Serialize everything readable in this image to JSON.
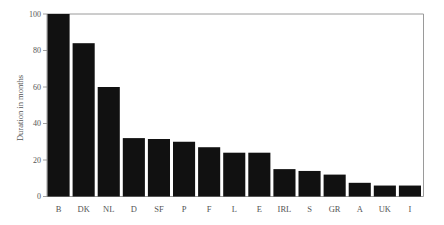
{
  "chart_data": {
    "type": "bar",
    "title": "",
    "xlabel": "",
    "ylabel": "Duration in months",
    "categories": [
      "B",
      "DK",
      "NL",
      "D",
      "SF",
      "P",
      "F",
      "L",
      "E",
      "IRL",
      "S",
      "GR",
      "A",
      "UK",
      "I"
    ],
    "values": [
      100,
      84,
      60,
      32,
      31.5,
      30,
      27,
      24,
      24,
      15,
      14,
      12,
      7.5,
      6,
      6
    ],
    "ylim": [
      0,
      100
    ],
    "yticks": [
      0,
      20,
      40,
      60,
      80,
      100
    ],
    "grid": false,
    "legend": null,
    "bar_color": "#111111"
  }
}
